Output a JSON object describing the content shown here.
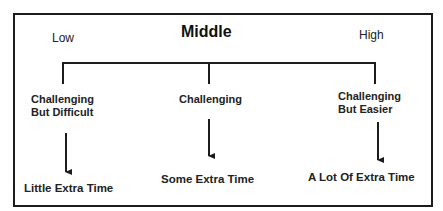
{
  "diagram": {
    "headers": {
      "low": "Low",
      "middle": "Middle",
      "high": "High"
    },
    "branches": [
      {
        "level": "Low",
        "challenge_line1": "Challenging",
        "challenge_line2": "But Difficult",
        "result": "Little Extra Time"
      },
      {
        "level": "Middle",
        "challenge_line1": "Challenging",
        "challenge_line2": "",
        "result": "Some Extra Time"
      },
      {
        "level": "High",
        "challenge_line1": "Challenging",
        "challenge_line2": "But Easier",
        "result": "A Lot Of Extra Time"
      }
    ],
    "colors": {
      "line": "#1c1c1c",
      "text": "#222222",
      "background": "#ffffff"
    }
  }
}
